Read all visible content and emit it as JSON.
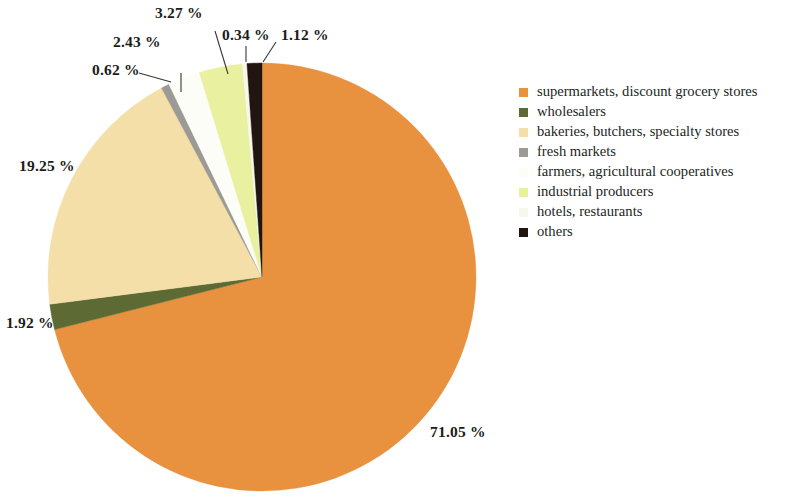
{
  "chart_data": {
    "type": "pie",
    "title": "",
    "legend_position": "right",
    "start_angle_deg": 0,
    "direction": "clockwise",
    "categories": [
      "supermarkets, discount grocery stores",
      "wholesalers",
      "bakeries, butchers, specialty stores",
      "fresh markets",
      "farmers, agricultural cooperatives",
      "industrial producers",
      "hotels, restaurants",
      "others"
    ],
    "values": [
      71.05,
      1.92,
      19.25,
      0.62,
      2.43,
      3.27,
      0.34,
      1.12
    ],
    "value_labels": [
      "71.05 %",
      "1.92 %",
      "19.25 %",
      "0.62 %",
      "2.43 %",
      "3.27 %",
      "0.34 %",
      "1.12 %"
    ],
    "colors": [
      "#e8913f",
      "#5d6a33",
      "#f5dfa8",
      "#9c9a94",
      "#fdfdf8",
      "#e9f0a0",
      "#f7f7ee",
      "#201510"
    ],
    "unit": "%",
    "total": 100.0
  },
  "legend": {
    "items": [
      {
        "label": "supermarkets, discount grocery stores",
        "color": "#e8913f"
      },
      {
        "label": "wholesalers",
        "color": "#5d6a33"
      },
      {
        "label": "bakeries, butchers, specialty stores",
        "color": "#f5dfa8"
      },
      {
        "label": "fresh markets",
        "color": "#9c9a94"
      },
      {
        "label": "farmers, agricultural cooperatives",
        "color": "#fdfdf8"
      },
      {
        "label": "industrial producers",
        "color": "#e9f0a0"
      },
      {
        "label": "hotels, restaurants",
        "color": "#f7f7ee"
      },
      {
        "label": "others",
        "color": "#201510"
      }
    ]
  },
  "labels": {
    "supermarkets": "71.05 %",
    "wholesalers": "1.92 %",
    "bakeries": "19.25 %",
    "fresh_markets": "0.62 %",
    "farmers": "2.43 %",
    "industrial": "3.27 %",
    "hotels": "0.34 %",
    "others": "1.12 %"
  }
}
